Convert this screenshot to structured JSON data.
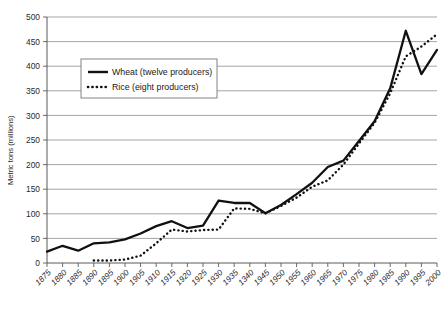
{
  "chart_data": {
    "type": "line",
    "title": "",
    "xlabel": "",
    "ylabel": "Metric tons (millions)",
    "ylim": [
      0,
      500
    ],
    "ytick_values": [
      0,
      50,
      100,
      150,
      200,
      250,
      300,
      350,
      400,
      450,
      500
    ],
    "ytick_labels": [
      "0",
      "50",
      "100",
      "150",
      "200",
      "250",
      "300",
      "350",
      "400",
      "450",
      "500"
    ],
    "grid": true,
    "legend_position": "upper-left-inside",
    "categories": [
      "1875",
      "1880",
      "1885",
      "1890",
      "1895",
      "1900",
      "1905",
      "1910",
      "1915",
      "1920",
      "1925",
      "1930",
      "1935",
      "1340",
      "1945",
      "1950",
      "1955",
      "1960",
      "1965",
      "1970",
      "1975",
      "1980",
      "1985",
      "1990",
      "1995",
      "2000"
    ],
    "x": [
      1875,
      1880,
      1885,
      1890,
      1895,
      1900,
      1905,
      1910,
      1915,
      1920,
      1925,
      1930,
      1935,
      1940,
      1945,
      1950,
      1955,
      1960,
      1965,
      1970,
      1975,
      1980,
      1985,
      1990,
      1995,
      2000
    ],
    "series": [
      {
        "name": "Wheat (twelve producers)",
        "style": "solid",
        "color": "#111111",
        "values": [
          23,
          35,
          25,
          40,
          42,
          48,
          60,
          75,
          85,
          71,
          76,
          127,
          122,
          122,
          101,
          118,
          140,
          163,
          195,
          208,
          248,
          288,
          355,
          472,
          384,
          433
        ]
      },
      {
        "name": "Rice (eight producers)",
        "style": "dotted",
        "color": "#111111",
        "values": [
          null,
          null,
          null,
          5,
          5,
          7,
          15,
          40,
          68,
          64,
          67,
          68,
          111,
          110,
          101,
          116,
          133,
          155,
          168,
          200,
          243,
          285,
          345,
          420,
          440,
          465
        ]
      }
    ],
    "legend": [
      {
        "label": "Wheat (twelve producers)",
        "style": "solid"
      },
      {
        "label": "Rice (eight producers)",
        "style": "dotted"
      }
    ]
  }
}
